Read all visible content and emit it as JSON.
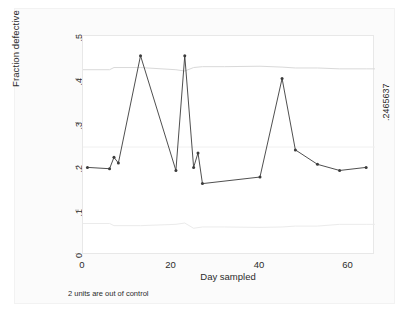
{
  "chart_data": {
    "type": "line",
    "title": "",
    "subtitle": "",
    "xlabel": "Day sampled",
    "ylabel": "Fraction defective",
    "xlim": [
      0,
      66
    ],
    "ylim": [
      0,
      0.5
    ],
    "xticks": [
      "0",
      "20",
      "40",
      "60"
    ],
    "xtick_values": [
      0,
      20,
      40,
      60
    ],
    "yticks": [
      "0",
      ".1",
      ".2",
      ".3",
      ".4",
      ".5"
    ],
    "ytick_values": [
      0,
      0.1,
      0.2,
      0.3,
      0.4,
      0.5
    ],
    "grid": false,
    "legend": "none",
    "annotation": "2 units are out of control",
    "center_line_label": ".2465637",
    "center_line_value": 0.2465637,
    "series": [
      {
        "name": "Fraction defective",
        "marker": "circle",
        "color": "#3b3b3b",
        "x": [
          1,
          6,
          7,
          8,
          13,
          21,
          23,
          25,
          26,
          27,
          40,
          45,
          48,
          53,
          58,
          64
        ],
        "values": [
          0.2,
          0.197,
          0.223,
          0.21,
          0.455,
          0.193,
          0.455,
          0.2,
          0.233,
          0.163,
          0.178,
          0.403,
          0.24,
          0.207,
          0.193,
          0.2
        ]
      },
      {
        "name": "Upper control limit",
        "marker": "none",
        "color": "#d9d9d9",
        "x": [
          0,
          6,
          7,
          13,
          21,
          23,
          25,
          27,
          32,
          40,
          45,
          48,
          53,
          58,
          64,
          66
        ],
        "values": [
          0.423,
          0.423,
          0.428,
          0.428,
          0.423,
          0.42,
          0.428,
          0.43,
          0.43,
          0.431,
          0.429,
          0.427,
          0.427,
          0.425,
          0.425,
          0.425
        ]
      },
      {
        "name": "Lower control limit",
        "marker": "none",
        "color": "#ebebeb",
        "x": [
          0,
          6,
          7,
          13,
          21,
          23,
          25,
          27,
          32,
          40,
          45,
          48,
          53,
          58,
          64,
          66
        ],
        "values": [
          0.072,
          0.072,
          0.067,
          0.067,
          0.07,
          0.073,
          0.061,
          0.064,
          0.064,
          0.063,
          0.064,
          0.066,
          0.066,
          0.07,
          0.07,
          0.07
        ]
      },
      {
        "name": "Center line",
        "marker": "none",
        "color": "#f0f0f0",
        "x": [
          0,
          66
        ],
        "values": [
          0.2465637,
          0.2465637
        ]
      }
    ]
  },
  "axes": {
    "y_title": "Fraction defective",
    "x_title": "Day sampled"
  },
  "footnote": {
    "text": "2 units are out of control"
  },
  "right_label": {
    "text": ".2465637"
  },
  "colors": {
    "data_line": "#3b3b3b",
    "limit_line": "#e0e0e0",
    "center_line": "#f0f0f0",
    "plot_background": "#ffffff",
    "graph_background": "#fbfbfb",
    "text": "#2b2b2b"
  }
}
